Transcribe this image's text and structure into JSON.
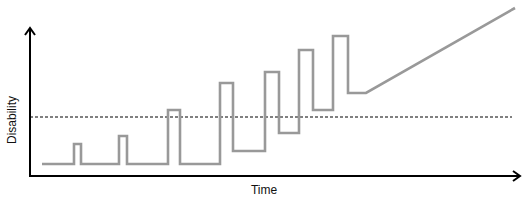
{
  "chart_data": {
    "type": "line",
    "title": "",
    "xlabel": "Time",
    "ylabel": "Disability",
    "grid": false,
    "legend": null,
    "axis_ticks": "none",
    "threshold_line": {
      "style": "dashed",
      "color": "#000000",
      "relative_level": 0.41,
      "description": "horizontal dashed threshold"
    },
    "series": [
      {
        "name": "Disability course",
        "color": "#999999",
        "description": "relapsing-remitting steps with rising baseline, then progressive linear increase",
        "points_px": [
          [
            42,
            164
          ],
          [
            74,
            164
          ],
          [
            74,
            144
          ],
          [
            81,
            144
          ],
          [
            81,
            164
          ],
          [
            119,
            164
          ],
          [
            119,
            136
          ],
          [
            127,
            136
          ],
          [
            127,
            164
          ],
          [
            168,
            164
          ],
          [
            168,
            110
          ],
          [
            180,
            110
          ],
          [
            180,
            164
          ],
          [
            220,
            164
          ],
          [
            220,
            83
          ],
          [
            233,
            83
          ],
          [
            233,
            151
          ],
          [
            265,
            151
          ],
          [
            265,
            72
          ],
          [
            279,
            72
          ],
          [
            279,
            133
          ],
          [
            299,
            133
          ],
          [
            299,
            50
          ],
          [
            313,
            50
          ],
          [
            313,
            110
          ],
          [
            333,
            110
          ],
          [
            333,
            36
          ],
          [
            348,
            36
          ],
          [
            348,
            93
          ],
          [
            366,
            93
          ],
          [
            515,
            8
          ]
        ]
      }
    ],
    "axes": {
      "x_axis_px": {
        "x1": 30,
        "y": 176,
        "x2": 520
      },
      "y_axis_px": {
        "x": 30,
        "y1": 176,
        "y2": 28
      },
      "threshold_px": {
        "x1": 30,
        "x2": 512,
        "y": 117
      }
    }
  },
  "labels": {
    "x_axis": "Time",
    "y_axis": "Disability"
  },
  "colors": {
    "axis": "#000000",
    "series": "#999999",
    "threshold": "#000000",
    "background": "#ffffff"
  }
}
